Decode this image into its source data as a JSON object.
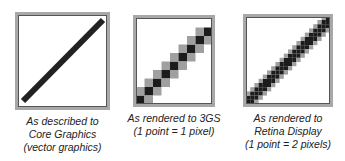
{
  "panels": [
    {
      "caption": [
        "As described to",
        "Core Graphics",
        "(vector graphics)"
      ]
    },
    {
      "caption": [
        "As rendered to 3GS",
        "(1 point = 1 pixel)"
      ]
    },
    {
      "caption": [
        "As rendered to",
        "Retina Display",
        "(1 point = 2 pixels)"
      ]
    }
  ],
  "colors": {
    "frame_outer": "#a8a8a8",
    "frame_inner": "#555555",
    "line": "#222222",
    "aa_gray": "#9a9a9a"
  }
}
